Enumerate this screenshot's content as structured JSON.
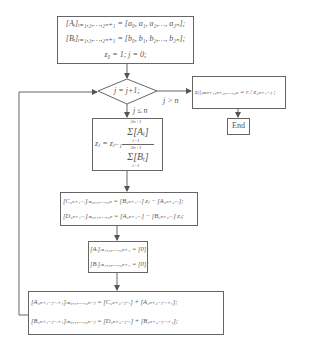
{
  "flowchart": {
    "init": {
      "line1": "[Aᵢ]ᵢ₌₁,₂,…,₂ₙ₊₁ = [a₀, a₁, a₂,…, a₂ₙ];",
      "line2": "[Bᵢ]ᵢ₌₁,₂,…,₂ₙ₊₁ = [b₀, b₁, b₂,…, b₂ₙ];",
      "line3": "z₀ = 1; j = 0;"
    },
    "decision": {
      "label": "j = j+1;",
      "yes_label": "j ≤ n",
      "no_label": "j > n"
    },
    "result": {
      "label": "zⱼ|ⱼ₌ₙ₊₁,ₙ₊₂,…,₂ₙ = r / z₂ₙ₊₁₋ⱼ ;"
    },
    "end": {
      "label": "End"
    },
    "sum": {
      "lhs": "zⱼ = zⱼ₋₁",
      "num": "Σ[Aᵢ]",
      "den": "Σ[Bᵢ]",
      "upper": "2n+1",
      "lower": "i=1"
    },
    "cd": {
      "line1": "[C₂ₙ₊₁₋ᵢ]ᵢ₌₀,₁,…,₂ₙ = [B₂ₙ₊₁₋ᵢ] zⱼ − [A₂ₙ₊₂₋ᵢ];",
      "line2": "[D₂ₙ₊₁₋ᵢ]ᵢ₌₀,₁,…,₂ₙ = [A₂ₙ₊₁₋ᵢ] − [B₂ₙ₊₂₋ᵢ] zⱼ;"
    },
    "zero": {
      "line1": "[Aᵢ]ᵢ₌₁,₂,…,₂ₙ₊₁ = [0];",
      "line2": "[Bᵢ]ᵢ₌₁,₂,…,₂ₙ₊₁ = [0];"
    },
    "update": {
      "line1": "[A₂ₙ₊₁₋ⱼ₋ᵢ₊₁]ᵢ₌₀,₁,…,₂ₙ₋ⱼ = [C₂ₙ₊₂₋ⱼ₋ᵢ] + [A₂ₙ₊₂₋ⱼ₋ᵢ₊₁];",
      "line2": "[B₂ₙ₊₁₋ⱼ₋ᵢ₊₁]ᵢ₌₀,₁,…,₂ₙ₋ⱼ = [D₂ₙ₊₂₋ⱼ₋ᵢ] + [B₂ₙ₊₂₋ⱼ₋ᵢ₊₁];"
    },
    "colors": {
      "stroke": "#666666",
      "text": "#555555",
      "background": "#ffffff"
    }
  }
}
